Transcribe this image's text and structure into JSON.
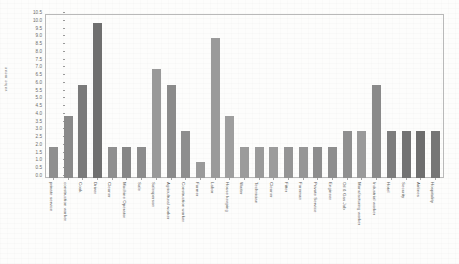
{
  "chart_data": {
    "type": "bar",
    "title": "",
    "xlabel": "",
    "ylabel": "value mean",
    "ylim": [
      0,
      10.5
    ],
    "grid": false,
    "legend": "none",
    "yticks": [
      "10.5",
      "10.0",
      "9.5",
      "9.0",
      "8.5",
      "8.0",
      "7.5",
      "7.0",
      "6.5",
      "6.0",
      "5.5",
      "5.0",
      "4.5",
      "4.0",
      "3.5",
      "3.0",
      "2.5",
      "2.0",
      "1.5",
      "1.0",
      "0.5",
      "0.0"
    ],
    "categories": [
      "private service",
      "construction worker",
      "Cook",
      "Driver",
      "Cleaner",
      "Machine Operator",
      "Sale",
      "Salesperson",
      "Agricultural worker",
      "Construction worker",
      "Farmer",
      "Labor",
      "House keeping",
      "Waiter",
      "Technician",
      "Cleaner",
      "Fitter",
      "Foreman",
      "Private Service",
      "Engineer",
      "Oil & Gas Job",
      "Manufacturing worker",
      "Industrial worker",
      "Hotel",
      "Security",
      "Airlines",
      "Hospitality"
    ],
    "values": [
      2.0,
      4.0,
      6.0,
      10.0,
      2.0,
      2.0,
      2.0,
      7.0,
      6.0,
      3.0,
      1.0,
      9.0,
      4.0,
      2.0,
      2.0,
      2.0,
      2.0,
      2.0,
      2.0,
      2.0,
      3.0,
      3.0,
      6.0,
      3.0,
      3.0,
      3.0,
      3.0
    ],
    "bar_colors": [
      "#8f8f8f",
      "#8a8a8a",
      "#7a7a7a",
      "#6f6f6f",
      "#8f8f8f",
      "#868686",
      "#8c8c8c",
      "#999999",
      "#8b8b8b",
      "#8e8e8e",
      "#9a9a9a",
      "#9a9a9a",
      "#9e9e9e",
      "#9b9b9b",
      "#9a9a9a",
      "#9c9c9c",
      "#949494",
      "#969696",
      "#8d8d8d",
      "#8e8e8e",
      "#8f8f8f",
      "#9a9a9a",
      "#8a8a8a",
      "#7d7d7d",
      "#737373",
      "#6e6e6e",
      "#767676"
    ],
    "colors": {
      "axis": "#b9b9b9",
      "text": "#5d5d5d",
      "background": "#fdfdfc"
    }
  }
}
